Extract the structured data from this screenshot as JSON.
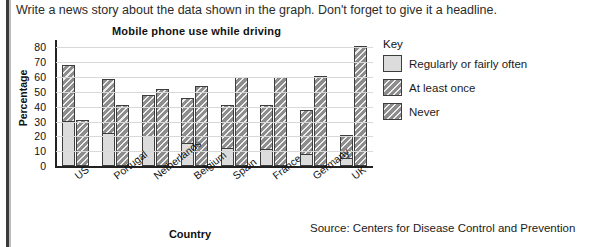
{
  "instruction": "Write a news story about the data shown in the graph. Don't forget to give it a headline.",
  "source_note": "Source: Centers for Disease Control and Prevention",
  "key": {
    "title": "Key",
    "items": [
      {
        "label": "Regularly or fairly often",
        "swatch": "light-solid-swatch",
        "color": "#dcdcdc"
      },
      {
        "label": "At least once",
        "swatch": "hatched-swatch",
        "color": "#8d8d8d"
      },
      {
        "label": "Never",
        "swatch": "hatched-swatch",
        "color": "#8d8d8d"
      }
    ]
  },
  "chart_data": {
    "type": "bar",
    "title": "Mobile phone use while driving",
    "xlabel": "Country",
    "ylabel": "Percentage",
    "ylim": [
      0,
      85
    ],
    "yticks": [
      0,
      10,
      20,
      30,
      40,
      50,
      60,
      70,
      80
    ],
    "grid": true,
    "legend_position": "right",
    "stacked_first_bar": true,
    "categories": [
      "US",
      "Portugal",
      "Netherlands",
      "Belgium",
      "Spain",
      "France",
      "Germany",
      "UK"
    ],
    "series": [
      {
        "name": "Regularly or fairly often",
        "values": [
          30,
          22,
          20,
          15,
          12,
          11,
          8,
          5
        ]
      },
      {
        "name": "At least once",
        "values": [
          68,
          59,
          48,
          46,
          41,
          41,
          38,
          21
        ]
      },
      {
        "name": "Never",
        "values": [
          31,
          41,
          52,
          54,
          60,
          60,
          61,
          81
        ]
      }
    ]
  }
}
